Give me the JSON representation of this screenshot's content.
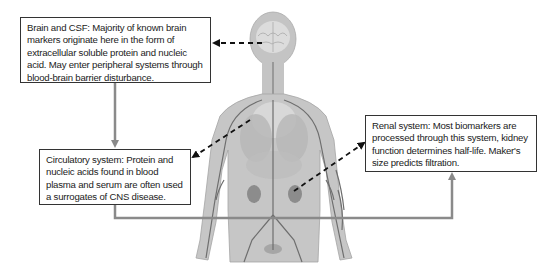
{
  "diagram": {
    "colors": {
      "body_fill": "#c8c8c8",
      "body_outline": "#9a9a9a",
      "vessel": "#6e6e6e",
      "flow_line": "#808080",
      "dashed_arrow": "#111111",
      "box_border": "#333333",
      "text": "#222222"
    },
    "boxes": {
      "brain": {
        "label": "Brain and CSF: Majority of known brain markers originate here in the form of extracellular soluble protein and nucleic acid. May enter peripheral systems through blood-brain barrier disturbance."
      },
      "circulatory": {
        "label": "Circulatory system: Protein and nucleic acids found in blood plasma and serum are often used a surrogates of CNS disease."
      },
      "renal": {
        "label": "Renal system: Most biomarkers are processed through this system, kidney function determines half-life. Maker's size predicts filtration."
      }
    },
    "connections": [
      {
        "from": "brain-box",
        "to": "circulatory-box",
        "style": "solid-gray-arrow"
      },
      {
        "from": "circulatory-box",
        "to": "renal-box",
        "style": "solid-gray-arrow"
      },
      {
        "from": "brain-organ",
        "to": "brain-box",
        "style": "dashed-arrow"
      },
      {
        "from": "heart-vessels",
        "to": "circulatory-box",
        "style": "dashed-arrow"
      },
      {
        "from": "kidney-organ",
        "to": "renal-box",
        "style": "dashed-arrow"
      }
    ]
  }
}
